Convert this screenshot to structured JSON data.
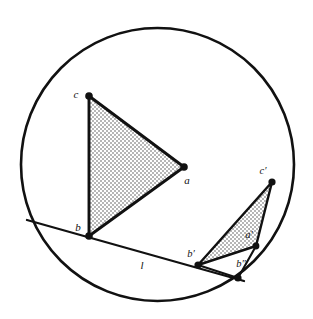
{
  "figure": {
    "background_color": "#ffffff",
    "stroke_color": "#111111",
    "fill_color": "#cccccc",
    "width": 313,
    "height": 319,
    "circle": {
      "name": "boundary-circle",
      "cx": 157.5,
      "cy": 164.5,
      "r": 136.5,
      "stroke_width": 2.6
    },
    "line_l": {
      "name": "line-l",
      "x1": 27,
      "y1": 220,
      "x2": 244,
      "y2": 281,
      "stroke_width": 2.2
    },
    "triangles": [
      {
        "name": "triangle-abc",
        "vertices": [
          {
            "id": "c",
            "x": 89,
            "y": 96
          },
          {
            "id": "a",
            "x": 184,
            "y": 167
          },
          {
            "id": "b",
            "x": 89,
            "y": 236
          }
        ],
        "stroke_width": 2.8
      },
      {
        "name": "triangle-a-b-c-prime",
        "vertices": [
          {
            "id": "c'",
            "x": 272,
            "y": 182
          },
          {
            "id": "a'",
            "x": 256,
            "y": 246
          },
          {
            "id": "b'",
            "x": 198,
            "y": 265
          }
        ],
        "stroke_width": 2.4
      }
    ],
    "points": [
      {
        "id": "pt-c",
        "label": "c",
        "x": 89,
        "y": 96,
        "lx": 76,
        "ly": 95,
        "r": 3.6
      },
      {
        "id": "pt-a",
        "label": "a",
        "x": 184,
        "y": 167,
        "lx": 187,
        "ly": 181,
        "r": 3.6
      },
      {
        "id": "pt-b",
        "label": "b",
        "x": 89,
        "y": 236,
        "lx": 78,
        "ly": 228,
        "r": 3.6
      },
      {
        "id": "pt-cp",
        "label": "c′",
        "x": 272,
        "y": 182,
        "lx": 263,
        "ly": 172,
        "r": 3.4
      },
      {
        "id": "pt-ap",
        "label": "a′",
        "x": 256,
        "y": 246,
        "lx": 249,
        "ly": 236,
        "r": 3.2
      },
      {
        "id": "pt-bp",
        "label": "b′",
        "x": 198,
        "y": 265,
        "lx": 191,
        "ly": 255,
        "r": 3.4
      },
      {
        "id": "pt-bpp",
        "label": "b″",
        "x": 238,
        "y": 278,
        "lx": 240,
        "ly": 265,
        "r": 3.4
      }
    ],
    "segment_b_prime_b_double_prime": {
      "name": "segment-bprime-bdoubleprime",
      "x1": 198,
      "y1": 265,
      "x2": 238,
      "y2": 278
    },
    "segment_b_double_prime_a_prime": {
      "name": "segment-bdoubleprime-aprime",
      "x1": 238,
      "y1": 278,
      "x2": 256,
      "y2": 246
    },
    "line_label": {
      "id": "label-l",
      "text": "l",
      "x": 142,
      "y": 266
    }
  }
}
